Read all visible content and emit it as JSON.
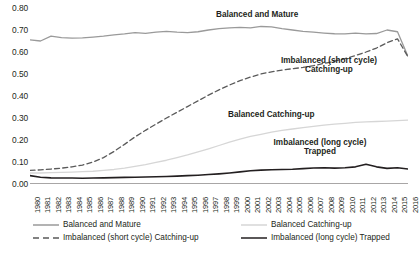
{
  "chart_data": {
    "type": "line",
    "title": "",
    "xlabel": "",
    "ylabel": "",
    "ylim": [
      0.0,
      0.8
    ],
    "xlim": [
      1980,
      2016
    ],
    "grid": false,
    "legend_position": "bottom",
    "y_ticks": [
      "0.00",
      "0.10",
      "0.20",
      "0.30",
      "0.40",
      "0.50",
      "0.60",
      "0.70",
      "0.80"
    ],
    "categories": [
      "1980",
      "1981",
      "1982",
      "1983",
      "1984",
      "1985",
      "1986",
      "1987",
      "1988",
      "1989",
      "1990",
      "1991",
      "1992",
      "1993",
      "1994",
      "1995",
      "1996",
      "1997",
      "1998",
      "1999",
      "2000",
      "2001",
      "2002",
      "2003",
      "2004",
      "2005",
      "2006",
      "2007",
      "2008",
      "2009",
      "2010",
      "2011",
      "2012",
      "2013",
      "2014",
      "2015",
      "2016"
    ],
    "series": [
      {
        "name": "Balanced and Mature",
        "style": "solid",
        "color": "#9a9a9a",
        "width": 1.3,
        "values": [
          0.655,
          0.65,
          0.672,
          0.665,
          0.663,
          0.664,
          0.668,
          0.672,
          0.678,
          0.682,
          0.688,
          0.685,
          0.69,
          0.694,
          0.69,
          0.688,
          0.692,
          0.7,
          0.706,
          0.71,
          0.712,
          0.71,
          0.716,
          0.714,
          0.706,
          0.7,
          0.694,
          0.69,
          0.686,
          0.683,
          0.682,
          0.686,
          0.682,
          0.684,
          0.7,
          0.692,
          0.58
        ]
      },
      {
        "name": "Imbalanced (short cycle) Catching-up",
        "style": "dashed",
        "color": "#5a5a5a",
        "width": 1.3,
        "values": [
          0.062,
          0.064,
          0.068,
          0.072,
          0.078,
          0.086,
          0.1,
          0.12,
          0.148,
          0.18,
          0.214,
          0.244,
          0.272,
          0.3,
          0.326,
          0.352,
          0.378,
          0.404,
          0.428,
          0.45,
          0.47,
          0.486,
          0.5,
          0.51,
          0.518,
          0.524,
          0.53,
          0.538,
          0.548,
          0.558,
          0.57,
          0.584,
          0.6,
          0.618,
          0.642,
          0.66,
          0.578
        ]
      },
      {
        "name": "Balanced Catching-up",
        "style": "solid",
        "color": "#d6d6d6",
        "width": 1.3,
        "values": [
          0.05,
          0.05,
          0.052,
          0.053,
          0.054,
          0.056,
          0.058,
          0.062,
          0.066,
          0.072,
          0.08,
          0.088,
          0.098,
          0.108,
          0.12,
          0.132,
          0.146,
          0.16,
          0.175,
          0.19,
          0.204,
          0.216,
          0.226,
          0.236,
          0.244,
          0.25,
          0.256,
          0.262,
          0.268,
          0.272,
          0.276,
          0.28,
          0.282,
          0.284,
          0.286,
          0.288,
          0.29
        ]
      },
      {
        "name": "Imbalanced (long cycle) Trapped",
        "style": "solid",
        "color": "#231f20",
        "width": 1.6,
        "values": [
          0.038,
          0.031,
          0.028,
          0.027,
          0.027,
          0.026,
          0.027,
          0.028,
          0.029,
          0.03,
          0.031,
          0.032,
          0.033,
          0.034,
          0.036,
          0.038,
          0.04,
          0.043,
          0.046,
          0.05,
          0.055,
          0.06,
          0.063,
          0.065,
          0.066,
          0.067,
          0.07,
          0.073,
          0.074,
          0.072,
          0.074,
          0.078,
          0.09,
          0.078,
          0.071,
          0.074,
          0.068
        ]
      }
    ],
    "annotations": [
      {
        "id": "balanced-mature",
        "text": "Balanced and Mature"
      },
      {
        "id": "imbalanced-short",
        "text": "Imbalanced (short cycle) Catching-up"
      },
      {
        "id": "balanced-catching",
        "text": "Balanced Catching-up"
      },
      {
        "id": "imbalanced-long",
        "text": "Imbalanced (long cycle) Trapped"
      }
    ],
    "legend": [
      {
        "label": "Balanced and Mature",
        "style": "solid",
        "color": "#9a9a9a"
      },
      {
        "label": "Balanced Catching-up",
        "style": "solid",
        "color": "#d6d6d6"
      },
      {
        "label": "Imbalanced (short cycle) Catching-up",
        "style": "dashed",
        "color": "#5a5a5a"
      },
      {
        "label": "Imbalanced (long cycle) Trapped",
        "style": "solid",
        "color": "#231f20"
      }
    ]
  }
}
